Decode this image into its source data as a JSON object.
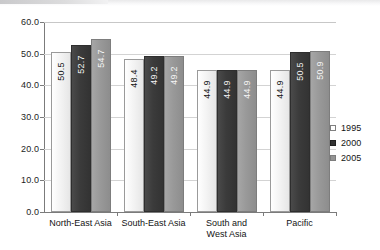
{
  "chart_data": {
    "type": "bar",
    "title": "",
    "subtitle": "",
    "xlabel": "",
    "ylabel": "",
    "ylim": [
      0.0,
      60.0
    ],
    "ytick_labels": [
      "60.0",
      "50.0",
      "40.0",
      "30.0",
      "20.0",
      "10.0",
      "0.0"
    ],
    "ytick_values": [
      60.0,
      50.0,
      40.0,
      30.0,
      20.0,
      10.0,
      0.0
    ],
    "grid": true,
    "legend_position": "right",
    "categories": [
      "North-East Asia",
      "South-East Asia",
      "South and\nWest Asia",
      "Pacific"
    ],
    "series": [
      {
        "name": "1995",
        "color": "#ffffff",
        "values": [
          50.5,
          48.4,
          44.9,
          44.9
        ]
      },
      {
        "name": "2000",
        "color": "#333333",
        "values": [
          52.7,
          49.2,
          44.9,
          50.5
        ]
      },
      {
        "name": "2005",
        "color": "#949494",
        "values": [
          54.7,
          49.2,
          44.9,
          50.9
        ]
      }
    ],
    "value_labels": [
      [
        "50.5",
        "52.7",
        "54.7"
      ],
      [
        "48.4",
        "49.2",
        "49.2"
      ],
      [
        "44.9",
        "44.9",
        "44.9"
      ],
      [
        "44.9",
        "50.5",
        "50.9"
      ]
    ]
  },
  "legend": {
    "items": [
      {
        "label": "1995"
      },
      {
        "label": "2000"
      },
      {
        "label": "2005"
      }
    ]
  }
}
